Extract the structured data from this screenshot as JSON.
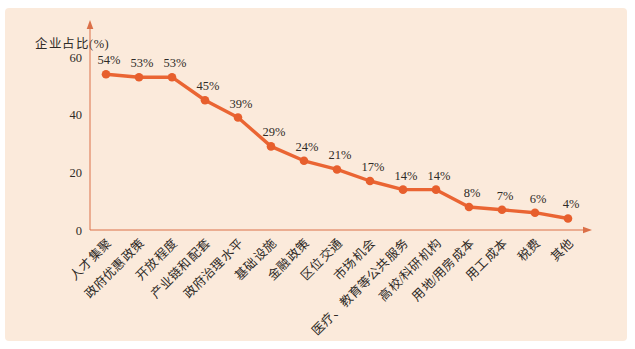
{
  "panel": {
    "background": "#fbeadb"
  },
  "chart_data": {
    "type": "line",
    "title": "",
    "xlabel": "",
    "ylabel": "企业占比(%)",
    "ylim": [
      0,
      60
    ],
    "yticks": [
      0,
      20,
      40,
      60
    ],
    "grid": false,
    "legend": null,
    "line_color": "#ea6533",
    "marker_color": "#e75f2d",
    "axis_color": "#db7048",
    "text_color": "#2f2b27",
    "categories": [
      "人才集聚",
      "政府优惠政策",
      "开放程度",
      "产业链和配套",
      "政府治理水平",
      "基础设施",
      "金融政策",
      "区位交通",
      "市场机会",
      "医疗、教育等公共服务",
      "高校/科研机构",
      "用地/用房成本",
      "用工成本",
      "税费",
      "其他"
    ],
    "values": [
      54,
      53,
      53,
      45,
      39,
      29,
      24,
      21,
      17,
      14,
      14,
      8,
      7,
      6,
      4
    ],
    "value_labels": [
      "54%",
      "53%",
      "53%",
      "45%",
      "39%",
      "29%",
      "24%",
      "21%",
      "17%",
      "14%",
      "14%",
      "8%",
      "7%",
      "6%",
      "4%"
    ]
  }
}
